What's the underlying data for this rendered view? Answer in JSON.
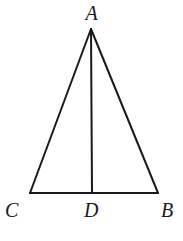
{
  "figure": {
    "type": "geometry-diagram",
    "width": 183,
    "height": 241,
    "background_color": "#ffffff",
    "stroke_color": "#1a1a1a",
    "stroke_width": 2,
    "points": {
      "A": {
        "label": "A",
        "x": 91,
        "y": 29
      },
      "B": {
        "label": "B",
        "x": 158,
        "y": 193
      },
      "C": {
        "label": "C",
        "x": 30,
        "y": 193
      },
      "D": {
        "label": "D",
        "x": 92,
        "y": 193
      }
    },
    "segments": [
      {
        "name": "side-AC",
        "from": "A",
        "to": "C"
      },
      {
        "name": "side-AB",
        "from": "A",
        "to": "B"
      },
      {
        "name": "base-CB",
        "from": "C",
        "to": "B"
      },
      {
        "name": "cevian-AD",
        "from": "A",
        "to": "D"
      }
    ],
    "labels": {
      "apex": "A",
      "base_left": "C",
      "base_mid": "D",
      "base_right": "B"
    }
  }
}
